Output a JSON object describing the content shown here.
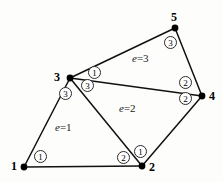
{
  "figure": {
    "background_color": "#fdfdfc",
    "line_color": "#111111",
    "width": 223,
    "height": 182
  },
  "nodes": [
    {
      "id": "n1",
      "label": "1",
      "x": 24,
      "y": 167,
      "label_x": 11,
      "label_y": 160
    },
    {
      "id": "n2",
      "label": "2",
      "x": 142,
      "y": 166,
      "label_x": 149,
      "label_y": 161
    },
    {
      "id": "n3",
      "label": "3",
      "x": 70,
      "y": 78,
      "label_x": 54,
      "label_y": 71
    },
    {
      "id": "n4",
      "label": "4",
      "x": 202,
      "y": 96,
      "label_x": 209,
      "label_y": 90
    },
    {
      "id": "n5",
      "label": "5",
      "x": 175,
      "y": 28,
      "label_x": 171,
      "label_y": 11
    }
  ],
  "edges": [
    {
      "id": "e-1-2",
      "from": "n1",
      "to": "n2",
      "x1": 24,
      "y1": 167,
      "x2": 142,
      "y2": 166
    },
    {
      "id": "e-1-3",
      "from": "n1",
      "to": "n3",
      "x1": 24,
      "y1": 167,
      "x2": 70,
      "y2": 78
    },
    {
      "id": "e-3-2",
      "from": "n3",
      "to": "n2",
      "x1": 70,
      "y1": 78,
      "x2": 142,
      "y2": 166
    },
    {
      "id": "e-2-4",
      "from": "n2",
      "to": "n4",
      "x1": 142,
      "y1": 166,
      "x2": 202,
      "y2": 96
    },
    {
      "id": "e-3-4",
      "from": "n3",
      "to": "n4",
      "x1": 70,
      "y1": 78,
      "x2": 202,
      "y2": 96
    },
    {
      "id": "e-3-5",
      "from": "n3",
      "to": "n5",
      "x1": 70,
      "y1": 78,
      "x2": 175,
      "y2": 28
    },
    {
      "id": "e-5-4",
      "from": "n5",
      "to": "n4",
      "x1": 175,
      "y1": 28,
      "x2": 202,
      "y2": 96
    }
  ],
  "elements": [
    {
      "id": "el1",
      "label_prefix": "e",
      "label_eq": "=",
      "label_value": "1",
      "text": "e=1",
      "x": 55,
      "y": 122,
      "nodes": [
        "n1",
        "n2",
        "n3"
      ]
    },
    {
      "id": "el2",
      "label_prefix": "e",
      "label_eq": "=",
      "label_value": "2",
      "text": "e=2",
      "x": 119,
      "y": 103,
      "nodes": [
        "n2",
        "n4",
        "n3"
      ]
    },
    {
      "id": "el3",
      "label_prefix": "e",
      "label_eq": "=",
      "label_value": "3",
      "text": "e=3",
      "x": 132,
      "y": 53,
      "nodes": [
        "n3",
        "n4",
        "n5"
      ]
    }
  ],
  "local_nodes": [
    {
      "id": "ln-e1-1",
      "element": "el1",
      "label": "1",
      "near_global": "n1",
      "x": 34,
      "y": 150
    },
    {
      "id": "ln-e1-2",
      "element": "el1",
      "label": "2",
      "near_global": "n2",
      "x": 117,
      "y": 151
    },
    {
      "id": "ln-e1-3",
      "element": "el1",
      "label": "3",
      "near_global": "n3",
      "x": 59,
      "y": 87
    },
    {
      "id": "ln-e2-1",
      "element": "el2",
      "label": "1",
      "near_global": "n2",
      "x": 134,
      "y": 145
    },
    {
      "id": "ln-e2-2",
      "element": "el2",
      "label": "2",
      "near_global": "n4",
      "x": 179,
      "y": 92
    },
    {
      "id": "ln-e2-3",
      "element": "el2",
      "label": "3",
      "near_global": "n3",
      "x": 81,
      "y": 79
    },
    {
      "id": "ln-e3-1",
      "element": "el3",
      "label": "1",
      "near_global": "n3",
      "x": 88,
      "y": 66
    },
    {
      "id": "ln-e3-2",
      "element": "el3",
      "label": "2",
      "near_global": "n4",
      "x": 179,
      "y": 76
    },
    {
      "id": "ln-e3-3",
      "element": "el3",
      "label": "3",
      "near_global": "n5",
      "x": 164,
      "y": 36
    }
  ],
  "chart_data": {
    "type": "diagram",
    "global_nodes": [
      {
        "number": 1,
        "x": 24,
        "y": 167
      },
      {
        "number": 2,
        "x": 142,
        "y": 166
      },
      {
        "number": 3,
        "x": 70,
        "y": 78
      },
      {
        "number": 4,
        "x": 202,
        "y": 96
      },
      {
        "number": 5,
        "x": 175,
        "y": 28
      }
    ],
    "element_connectivity": [
      {
        "element": 1,
        "global_nodes": [
          1,
          2,
          3
        ],
        "local_numbers": [
          1,
          2,
          3
        ]
      },
      {
        "element": 2,
        "global_nodes": [
          2,
          4,
          3
        ],
        "local_numbers": [
          1,
          2,
          3
        ]
      },
      {
        "element": 3,
        "global_nodes": [
          3,
          4,
          5
        ],
        "local_numbers": [
          1,
          2,
          3
        ]
      }
    ],
    "element_labels": [
      "e=1",
      "e=2",
      "e=3"
    ]
  }
}
